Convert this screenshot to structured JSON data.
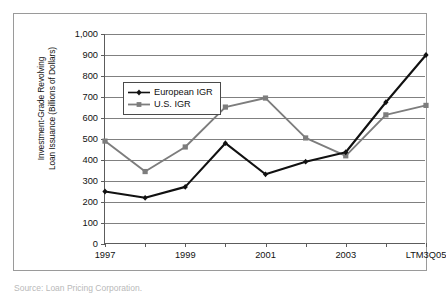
{
  "figure": {
    "caption": "Source: Loan Pricing Corporation."
  },
  "axes": {
    "y_title": "Investment-Grade Revolving\nLoan Issuance (Billions of Dollars)",
    "y_ticks": [
      "0",
      "100",
      "200",
      "300",
      "400",
      "500",
      "600",
      "700",
      "800",
      "900",
      "1,000"
    ],
    "x_ticks": [
      "1997",
      "",
      "1999",
      "",
      "2001",
      "",
      "2003",
      "",
      "LTM3Q05"
    ]
  },
  "legend": {
    "position": "inside-top-left",
    "entries": [
      {
        "label": "European IGR",
        "color": "#111111",
        "marker": "diamond"
      },
      {
        "label": "U.S. IGR",
        "color": "#7d7d7d",
        "marker": "square"
      }
    ]
  },
  "colors": {
    "european": "#111111",
    "us": "#7d7d7d",
    "gridline": "#808080",
    "axis": "#5c5c5c",
    "frame": "#9a9a9a"
  },
  "chart_data": {
    "type": "line",
    "title": "",
    "xlabel": "",
    "ylabel": "Investment-Grade Revolving Loan Issuance (Billions of Dollars)",
    "categories": [
      "1997",
      "1998",
      "1999",
      "2000",
      "2001",
      "2002",
      "2003",
      "2004",
      "LTM3Q05"
    ],
    "tick_labels_shown": [
      "1997",
      "",
      "1999",
      "",
      "2001",
      "",
      "2003",
      "",
      "LTM3Q05"
    ],
    "ylim": [
      0,
      1000
    ],
    "ytick_step": 100,
    "grid": true,
    "legend_position": "upper left (inside plot)",
    "series": [
      {
        "name": "European IGR",
        "color": "#111111",
        "marker": "diamond",
        "values": [
          250,
          220,
          272,
          480,
          332,
          392,
          437,
          675,
          900
        ]
      },
      {
        "name": "U.S. IGR",
        "color": "#7d7d7d",
        "marker": "square",
        "values": [
          490,
          345,
          462,
          652,
          695,
          505,
          420,
          615,
          660
        ]
      }
    ]
  }
}
